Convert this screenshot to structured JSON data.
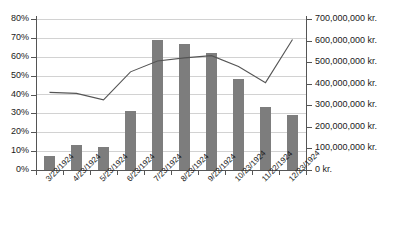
{
  "chart_data": {
    "type": "bar",
    "title": "",
    "xlabel": "",
    "ylabel": "",
    "grid": true,
    "legend": "none",
    "categories": [
      "3/22/1924",
      "4/23/1924",
      "5/23/1924",
      "6/23/1924",
      "7/23/1924",
      "8/23/1924",
      "9/22/1924",
      "10/23/1924",
      "11/22/1924",
      "12/23/1924"
    ],
    "series": [
      {
        "name": "Percent",
        "type": "bar",
        "axis": "left",
        "values": [
          7.5,
          13.0,
          12.0,
          31.0,
          69.0,
          67.0,
          62.0,
          48.0,
          33.5,
          29.0
        ],
        "color": "#7d7d7d"
      },
      {
        "name": "Amount",
        "type": "line",
        "axis": "right",
        "values": [
          360000000,
          355000000,
          325000000,
          455000000,
          505000000,
          520000000,
          530000000,
          480000000,
          405000000,
          605000000
        ],
        "color": "#555555"
      }
    ],
    "left_axis": {
      "min": 0,
      "max": 80,
      "step": 10,
      "suffix": "%",
      "ticks": [
        "0%",
        "10%",
        "20%",
        "30%",
        "40%",
        "50%",
        "60%",
        "70%",
        "80%"
      ]
    },
    "right_axis": {
      "min": 0,
      "max": 700000000,
      "step": 100000000,
      "suffix": " kr.",
      "ticks": [
        "0 kr.",
        "100,000,000 kr.",
        "200,000,000 kr.",
        "300,000,000 kr.",
        "400,000,000 kr.",
        "500,000,000 kr.",
        "600,000,000 kr.",
        "700,000,000 kr."
      ]
    }
  },
  "caption": ""
}
